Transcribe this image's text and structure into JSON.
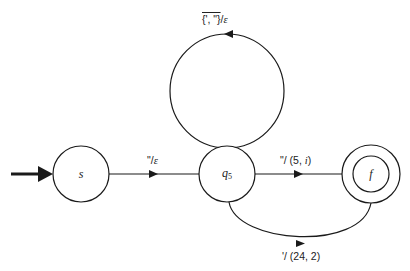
{
  "diagram": {
    "type": "state-machine",
    "colors": {
      "stroke": "#1a1a1a",
      "background": "#ffffff",
      "text": "#222222"
    },
    "states": [
      {
        "id": "s",
        "label": "s",
        "subscript": "",
        "start": true,
        "accepting": false
      },
      {
        "id": "q5",
        "label": "q",
        "subscript": "5",
        "start": false,
        "accepting": false
      },
      {
        "id": "f",
        "label": "f",
        "subscript": "",
        "start": false,
        "accepting": true
      }
    ],
    "transitions": [
      {
        "from": "q5",
        "to": "q5",
        "input": "{', \"}",
        "input_overlined": true,
        "sep": "/",
        "output": "ε"
      },
      {
        "from": "s",
        "to": "q5",
        "input": "\"",
        "sep": "/",
        "output": "ε"
      },
      {
        "from": "q5",
        "to": "f",
        "input": "\"",
        "sep": "/ ",
        "output": "(5, ",
        "output_italic": "i",
        "output_end": ")"
      },
      {
        "from": "q5",
        "to": "f",
        "input": "'",
        "sep": "/ ",
        "output": "(24, 2)"
      }
    ]
  }
}
